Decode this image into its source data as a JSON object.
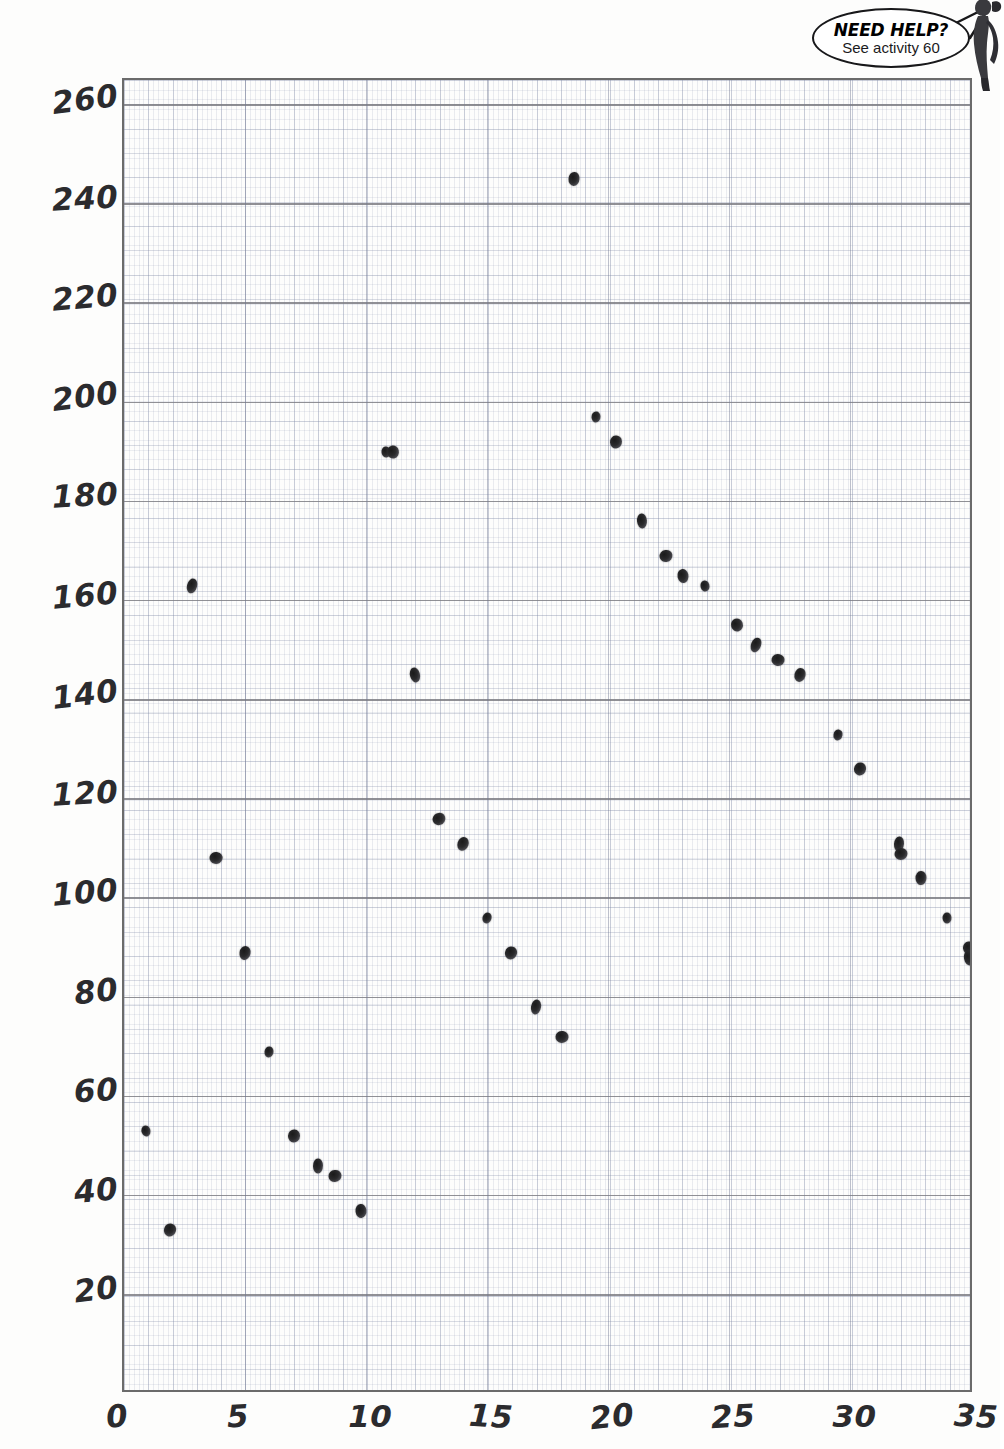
{
  "callout": {
    "headline": "NEED HELP?",
    "subtext": "See activity 60",
    "bubble_name": "need-help-speech-bubble"
  },
  "chart_data": {
    "type": "scatter",
    "title": "",
    "subtitle": "",
    "xlabel": "",
    "ylabel": "",
    "xlim": [
      0,
      35.1
    ],
    "ylim": [
      0,
      265
    ],
    "grid": true,
    "grid_style": "graph-paper, minor dotted, major solid every 20 on y",
    "legend": "none",
    "legend_position": "none",
    "x_ticks": [
      0,
      5,
      10,
      15,
      20,
      25,
      30,
      35
    ],
    "x_tick_labels": [
      "0",
      "5",
      "10",
      "15",
      "20",
      "25",
      "30",
      "35"
    ],
    "y_ticks": [
      20,
      40,
      60,
      80,
      100,
      120,
      140,
      160,
      180,
      200,
      220,
      240,
      260
    ],
    "y_tick_labels": [
      "20",
      "40",
      "60",
      "80",
      "100",
      "120",
      "140",
      "160",
      "180",
      "200",
      "220",
      "240",
      "260"
    ],
    "y_major_gridlines": [
      20,
      40,
      60,
      80,
      100,
      120,
      140,
      160,
      180,
      200,
      220,
      240,
      260
    ],
    "series": [
      {
        "name": "data",
        "marker": "pencil-dot",
        "color": "#222226",
        "points": [
          {
            "x": 0.9,
            "y": 53
          },
          {
            "x": 1.9,
            "y": 33
          },
          {
            "x": 2.8,
            "y": 163
          },
          {
            "x": 3.8,
            "y": 108
          },
          {
            "x": 5.0,
            "y": 89
          },
          {
            "x": 6.0,
            "y": 69
          },
          {
            "x": 7.0,
            "y": 52
          },
          {
            "x": 8.0,
            "y": 46
          },
          {
            "x": 8.7,
            "y": 44
          },
          {
            "x": 9.8,
            "y": 37
          },
          {
            "x": 10.8,
            "y": 190
          },
          {
            "x": 11.1,
            "y": 190
          },
          {
            "x": 12.0,
            "y": 145
          },
          {
            "x": 13.0,
            "y": 116
          },
          {
            "x": 14.0,
            "y": 111
          },
          {
            "x": 15.0,
            "y": 96
          },
          {
            "x": 16.0,
            "y": 89
          },
          {
            "x": 17.0,
            "y": 78
          },
          {
            "x": 18.1,
            "y": 72
          },
          {
            "x": 18.6,
            "y": 245
          },
          {
            "x": 19.5,
            "y": 197
          },
          {
            "x": 20.3,
            "y": 192
          },
          {
            "x": 21.4,
            "y": 176
          },
          {
            "x": 22.4,
            "y": 169
          },
          {
            "x": 23.1,
            "y": 165
          },
          {
            "x": 24.0,
            "y": 163
          },
          {
            "x": 25.3,
            "y": 155
          },
          {
            "x": 26.1,
            "y": 151
          },
          {
            "x": 27.0,
            "y": 148
          },
          {
            "x": 27.9,
            "y": 145
          },
          {
            "x": 29.5,
            "y": 133
          },
          {
            "x": 30.4,
            "y": 126
          },
          {
            "x": 32.0,
            "y": 111
          },
          {
            "x": 32.1,
            "y": 109
          },
          {
            "x": 32.9,
            "y": 104
          },
          {
            "x": 34.0,
            "y": 96
          },
          {
            "x": 34.9,
            "y": 90
          },
          {
            "x": 34.9,
            "y": 88
          }
        ]
      }
    ]
  }
}
